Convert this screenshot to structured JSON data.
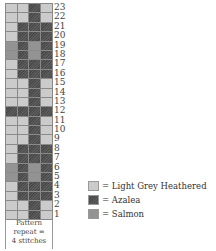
{
  "chart": {
    "rows": [
      {
        "num": "23",
        "cells": [
          "L",
          "L",
          "A",
          "L"
        ]
      },
      {
        "num": "22",
        "cells": [
          "L",
          "L",
          "A",
          "L"
        ]
      },
      {
        "num": "21",
        "cells": [
          "L",
          "A",
          "A",
          "A"
        ]
      },
      {
        "num": "20",
        "cells": [
          "L",
          "A",
          "A",
          "A"
        ]
      },
      {
        "num": "19",
        "cells": [
          "S",
          "A",
          "S",
          "A"
        ]
      },
      {
        "num": "18",
        "cells": [
          "S",
          "A",
          "S",
          "A"
        ]
      },
      {
        "num": "17",
        "cells": [
          "L",
          "A",
          "A",
          "A"
        ]
      },
      {
        "num": "16",
        "cells": [
          "L",
          "A",
          "A",
          "A"
        ]
      },
      {
        "num": "15",
        "cells": [
          "L",
          "L",
          "A",
          "L"
        ]
      },
      {
        "num": "14",
        "cells": [
          "L",
          "L",
          "A",
          "L"
        ]
      },
      {
        "num": "13",
        "cells": [
          "L",
          "L",
          "A",
          "L"
        ]
      },
      {
        "num": "12",
        "cells": [
          "A",
          "A",
          "A",
          "A"
        ]
      },
      {
        "num": "11",
        "cells": [
          "L",
          "L",
          "A",
          "L"
        ]
      },
      {
        "num": "10",
        "cells": [
          "L",
          "L",
          "A",
          "L"
        ]
      },
      {
        "num": "9",
        "cells": [
          "L",
          "L",
          "A",
          "L"
        ]
      },
      {
        "num": "8",
        "cells": [
          "L",
          "A",
          "A",
          "A"
        ]
      },
      {
        "num": "7",
        "cells": [
          "L",
          "A",
          "A",
          "A"
        ]
      },
      {
        "num": "6",
        "cells": [
          "S",
          "A",
          "S",
          "A"
        ]
      },
      {
        "num": "5",
        "cells": [
          "S",
          "A",
          "S",
          "A"
        ]
      },
      {
        "num": "4",
        "cells": [
          "L",
          "A",
          "A",
          "A"
        ]
      },
      {
        "num": "3",
        "cells": [
          "L",
          "A",
          "A",
          "A"
        ]
      },
      {
        "num": "2",
        "cells": [
          "L",
          "L",
          "A",
          "L"
        ]
      },
      {
        "num": "1",
        "cells": [
          "L",
          "L",
          "A",
          "L"
        ]
      }
    ],
    "repeat_label": [
      "Pattern",
      "repeat =",
      "4 stitches"
    ]
  },
  "legend": [
    {
      "key": "L",
      "label": "= Light Grey Heathered",
      "color": "#cbcbcb"
    },
    {
      "key": "A",
      "label": "= Azalea",
      "color": "#4f4f4f"
    },
    {
      "key": "S",
      "label": "= Salmon",
      "color": "#939393"
    }
  ]
}
